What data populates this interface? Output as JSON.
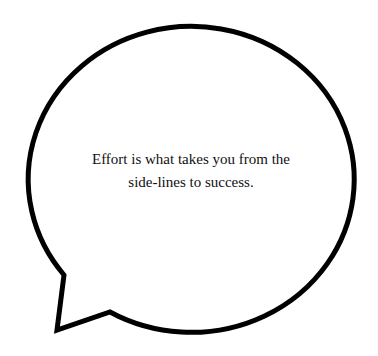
{
  "bubble": {
    "stroke_color": "#000000",
    "fill_color": "#ffffff",
    "stroke_width": 5
  },
  "quote": {
    "lines": [
      "Effort is what takes you from the",
      "side-lines to success."
    ]
  }
}
